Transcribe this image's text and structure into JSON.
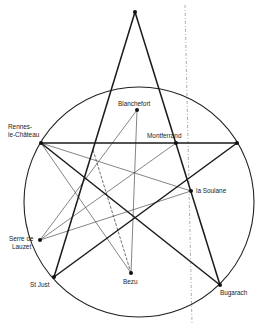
{
  "diagram": {
    "title": "",
    "circle": {
      "cx": 139,
      "cy": 202,
      "r": 115
    },
    "points": {
      "apex": {
        "x": 135,
        "y": 12,
        "label": ""
      },
      "rennes": {
        "x": 41,
        "y": 143,
        "label_line1": "Rennes-",
        "label_line2": "le-Château"
      },
      "blanchefort": {
        "x": 137,
        "y": 110,
        "label": "Blanchefort"
      },
      "montferrand": {
        "x": 176,
        "y": 143,
        "label": "Montferrand"
      },
      "right": {
        "x": 237,
        "y": 143,
        "label": ""
      },
      "la_soulane": {
        "x": 191,
        "y": 191,
        "label": "la Soulane"
      },
      "serre": {
        "x": 40,
        "y": 240,
        "label_line1": "Serre de",
        "label_line2": "Lauzet"
      },
      "st_just": {
        "x": 54,
        "y": 277,
        "label": "St Just"
      },
      "bezu": {
        "x": 131,
        "y": 273,
        "label": "Bezu"
      },
      "bugarach": {
        "x": 220,
        "y": 285,
        "label": "Bugarach"
      }
    },
    "pentagram_edges": [
      [
        "apex",
        "st_just"
      ],
      [
        "apex",
        "bugarach"
      ],
      [
        "rennes",
        "right"
      ],
      [
        "rennes",
        "bugarach"
      ],
      [
        "st_just",
        "right"
      ]
    ],
    "thin_edges": [
      [
        "rennes",
        "la_soulane"
      ],
      [
        "rennes",
        "bezu"
      ],
      [
        "blanchefort",
        "bezu"
      ],
      [
        "blanchefort",
        "serre"
      ],
      [
        "montferrand",
        "serre"
      ],
      [
        "serre",
        "la_soulane"
      ]
    ],
    "dashed_edges": [
      {
        "from": [
          93,
          150
        ],
        "to": "bezu"
      }
    ],
    "meridian": {
      "x1": 185,
      "y1": 5,
      "x2": 192,
      "y2": 324
    }
  }
}
